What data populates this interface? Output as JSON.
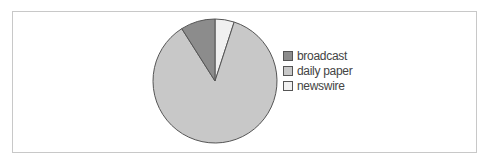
{
  "chart_data": {
    "type": "pie",
    "title": "",
    "categories": [
      "broadcast",
      "daily paper",
      "newswire"
    ],
    "values": [
      9,
      86,
      5
    ],
    "colors": [
      "#8c8c8c",
      "#c8c8c8",
      "#f0f0f0"
    ],
    "legend_position": "right",
    "start_angle": "12 o'clock, counterclockwise for broadcast"
  },
  "legend": {
    "items": [
      {
        "label": "broadcast",
        "color": "#8c8c8c"
      },
      {
        "label": "daily paper",
        "color": "#c8c8c8"
      },
      {
        "label": "newswire",
        "color": "#f0f0f0"
      }
    ]
  }
}
